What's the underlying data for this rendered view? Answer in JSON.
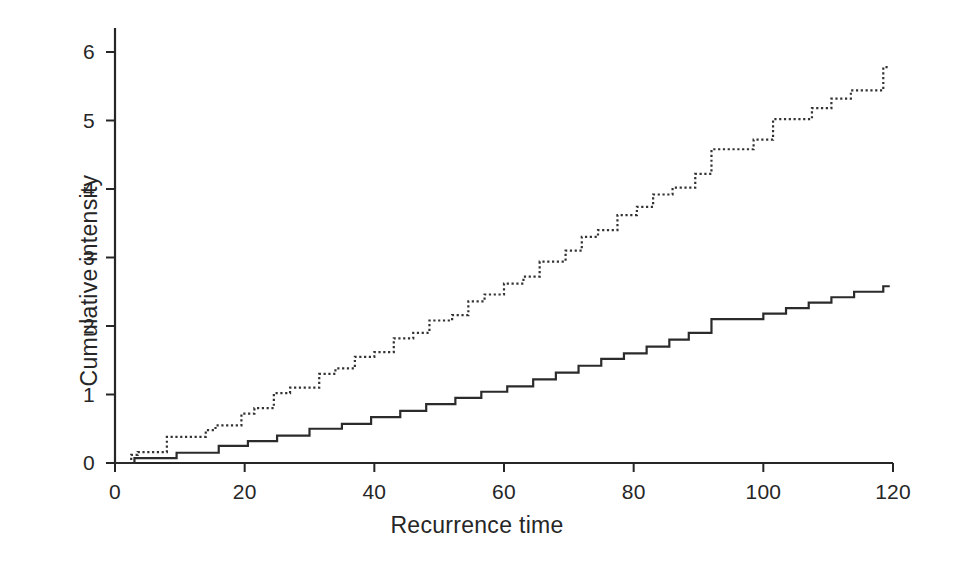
{
  "chart_data": {
    "type": "line",
    "subtype": "step",
    "title": "",
    "xlabel": "Recurrence time",
    "ylabel": "Cumulative intensity",
    "xlim": [
      0,
      122
    ],
    "ylim": [
      0,
      6.3
    ],
    "xticks": [
      0,
      20,
      40,
      60,
      80,
      100,
      120
    ],
    "yticks": [
      0,
      1,
      2,
      3,
      4,
      5,
      6
    ],
    "xtick_labels": [
      "0",
      "20",
      "40",
      "60",
      "80",
      "100",
      "120"
    ],
    "ytick_labels": [
      "0",
      "1",
      "2",
      "3",
      "4",
      "5",
      "6"
    ],
    "grid": false,
    "legend": "none",
    "axis_color": "#262626",
    "series": [
      {
        "name": "dotted-cumulative-intensity",
        "style": "dotted",
        "color": "#333333",
        "points": [
          [
            0,
            0.0
          ],
          [
            2.5,
            0.0
          ],
          [
            2.5,
            0.12
          ],
          [
            3.5,
            0.12
          ],
          [
            3.5,
            0.16
          ],
          [
            8.0,
            0.16
          ],
          [
            8.0,
            0.38
          ],
          [
            14.0,
            0.38
          ],
          [
            14.0,
            0.48
          ],
          [
            15.5,
            0.48
          ],
          [
            15.5,
            0.55
          ],
          [
            19.5,
            0.55
          ],
          [
            19.5,
            0.72
          ],
          [
            21.5,
            0.72
          ],
          [
            21.5,
            0.8
          ],
          [
            24.5,
            0.8
          ],
          [
            24.5,
            1.02
          ],
          [
            27.0,
            1.02
          ],
          [
            27.0,
            1.1
          ],
          [
            31.5,
            1.1
          ],
          [
            31.5,
            1.3
          ],
          [
            34.0,
            1.3
          ],
          [
            34.0,
            1.38
          ],
          [
            37.0,
            1.38
          ],
          [
            37.0,
            1.55
          ],
          [
            40.0,
            1.55
          ],
          [
            40.0,
            1.62
          ],
          [
            43.0,
            1.62
          ],
          [
            43.0,
            1.82
          ],
          [
            46.0,
            1.82
          ],
          [
            46.0,
            1.9
          ],
          [
            48.5,
            1.9
          ],
          [
            48.5,
            2.08
          ],
          [
            52.0,
            2.08
          ],
          [
            52.0,
            2.16
          ],
          [
            54.5,
            2.16
          ],
          [
            54.5,
            2.36
          ],
          [
            57.0,
            2.36
          ],
          [
            57.0,
            2.46
          ],
          [
            60.0,
            2.46
          ],
          [
            60.0,
            2.62
          ],
          [
            63.0,
            2.62
          ],
          [
            63.0,
            2.72
          ],
          [
            65.5,
            2.72
          ],
          [
            65.5,
            2.94
          ],
          [
            69.5,
            2.94
          ],
          [
            69.5,
            3.1
          ],
          [
            72.0,
            3.1
          ],
          [
            72.0,
            3.3
          ],
          [
            74.5,
            3.3
          ],
          [
            74.5,
            3.4
          ],
          [
            77.5,
            3.4
          ],
          [
            77.5,
            3.62
          ],
          [
            80.5,
            3.62
          ],
          [
            80.5,
            3.74
          ],
          [
            83.0,
            3.74
          ],
          [
            83.0,
            3.92
          ],
          [
            86.0,
            3.92
          ],
          [
            86.0,
            4.02
          ],
          [
            89.5,
            4.02
          ],
          [
            89.5,
            4.22
          ],
          [
            92.0,
            4.22
          ],
          [
            92.0,
            4.58
          ],
          [
            98.5,
            4.58
          ],
          [
            98.5,
            4.72
          ],
          [
            101.5,
            4.72
          ],
          [
            101.5,
            5.02
          ],
          [
            107.5,
            5.02
          ],
          [
            107.5,
            5.18
          ],
          [
            110.5,
            5.18
          ],
          [
            110.5,
            5.32
          ],
          [
            113.5,
            5.32
          ],
          [
            113.5,
            5.44
          ],
          [
            118.5,
            5.44
          ],
          [
            118.5,
            5.78
          ],
          [
            119.5,
            5.78
          ]
        ]
      },
      {
        "name": "solid-cumulative-intensity",
        "style": "solid",
        "color": "#2b2b2b",
        "points": [
          [
            0,
            0.0
          ],
          [
            3.0,
            0.0
          ],
          [
            3.0,
            0.07
          ],
          [
            9.5,
            0.07
          ],
          [
            9.5,
            0.15
          ],
          [
            16.0,
            0.15
          ],
          [
            16.0,
            0.25
          ],
          [
            20.5,
            0.25
          ],
          [
            20.5,
            0.32
          ],
          [
            25.0,
            0.32
          ],
          [
            25.0,
            0.4
          ],
          [
            30.0,
            0.4
          ],
          [
            30.0,
            0.5
          ],
          [
            35.0,
            0.5
          ],
          [
            35.0,
            0.57
          ],
          [
            39.5,
            0.57
          ],
          [
            39.5,
            0.67
          ],
          [
            44.0,
            0.67
          ],
          [
            44.0,
            0.76
          ],
          [
            48.0,
            0.76
          ],
          [
            48.0,
            0.86
          ],
          [
            52.5,
            0.86
          ],
          [
            52.5,
            0.95
          ],
          [
            56.5,
            0.95
          ],
          [
            56.5,
            1.04
          ],
          [
            60.5,
            1.04
          ],
          [
            60.5,
            1.12
          ],
          [
            64.5,
            1.12
          ],
          [
            64.5,
            1.22
          ],
          [
            68.0,
            1.22
          ],
          [
            68.0,
            1.32
          ],
          [
            71.5,
            1.32
          ],
          [
            71.5,
            1.42
          ],
          [
            75.0,
            1.42
          ],
          [
            75.0,
            1.52
          ],
          [
            78.5,
            1.52
          ],
          [
            78.5,
            1.6
          ],
          [
            82.0,
            1.6
          ],
          [
            82.0,
            1.7
          ],
          [
            85.5,
            1.7
          ],
          [
            85.5,
            1.8
          ],
          [
            88.5,
            1.8
          ],
          [
            88.5,
            1.9
          ],
          [
            92.0,
            1.9
          ],
          [
            92.0,
            2.1
          ],
          [
            100.0,
            2.1
          ],
          [
            100.0,
            2.18
          ],
          [
            103.5,
            2.18
          ],
          [
            103.5,
            2.26
          ],
          [
            107.0,
            2.26
          ],
          [
            107.0,
            2.34
          ],
          [
            110.5,
            2.34
          ],
          [
            110.5,
            2.42
          ],
          [
            114.0,
            2.42
          ],
          [
            114.0,
            2.5
          ],
          [
            118.5,
            2.5
          ],
          [
            118.5,
            2.58
          ],
          [
            119.5,
            2.58
          ]
        ]
      }
    ]
  }
}
